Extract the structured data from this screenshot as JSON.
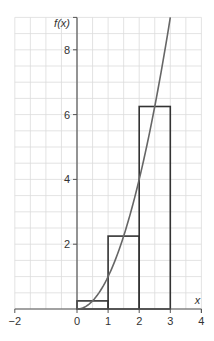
{
  "chart_data": {
    "type": "line",
    "title": "",
    "xlabel": "x",
    "ylabel": "f(x)",
    "xlim": [
      -2,
      4
    ],
    "ylim": [
      0,
      9
    ],
    "grid": true,
    "grid_step": 0.5,
    "x_ticks": [
      -2,
      0,
      1,
      2,
      3,
      4
    ],
    "x_tick_labels": [
      "−2",
      "0",
      "1",
      "2",
      "3",
      "4"
    ],
    "y_ticks": [
      2,
      4,
      6,
      8
    ],
    "y_tick_labels": [
      "2",
      "4",
      "6",
      "8"
    ],
    "series": [
      {
        "name": "f(x) = x²",
        "type": "line",
        "x": [
          0,
          0.5,
          1,
          1.5,
          2,
          2.5,
          3
        ],
        "y": [
          0,
          0.25,
          1,
          2.25,
          4,
          6.25,
          9
        ]
      }
    ],
    "rectangles": [
      {
        "x0": 0,
        "x1": 1,
        "height": 0.25
      },
      {
        "x0": 1,
        "x1": 2,
        "height": 2.25
      },
      {
        "x0": 2,
        "x1": 3,
        "height": 6.25
      }
    ],
    "legend": null
  },
  "colors": {
    "grid": "#dcdcdc",
    "axis": "#555555",
    "curve": "#666666",
    "rect": "#333333",
    "text": "#333333"
  }
}
